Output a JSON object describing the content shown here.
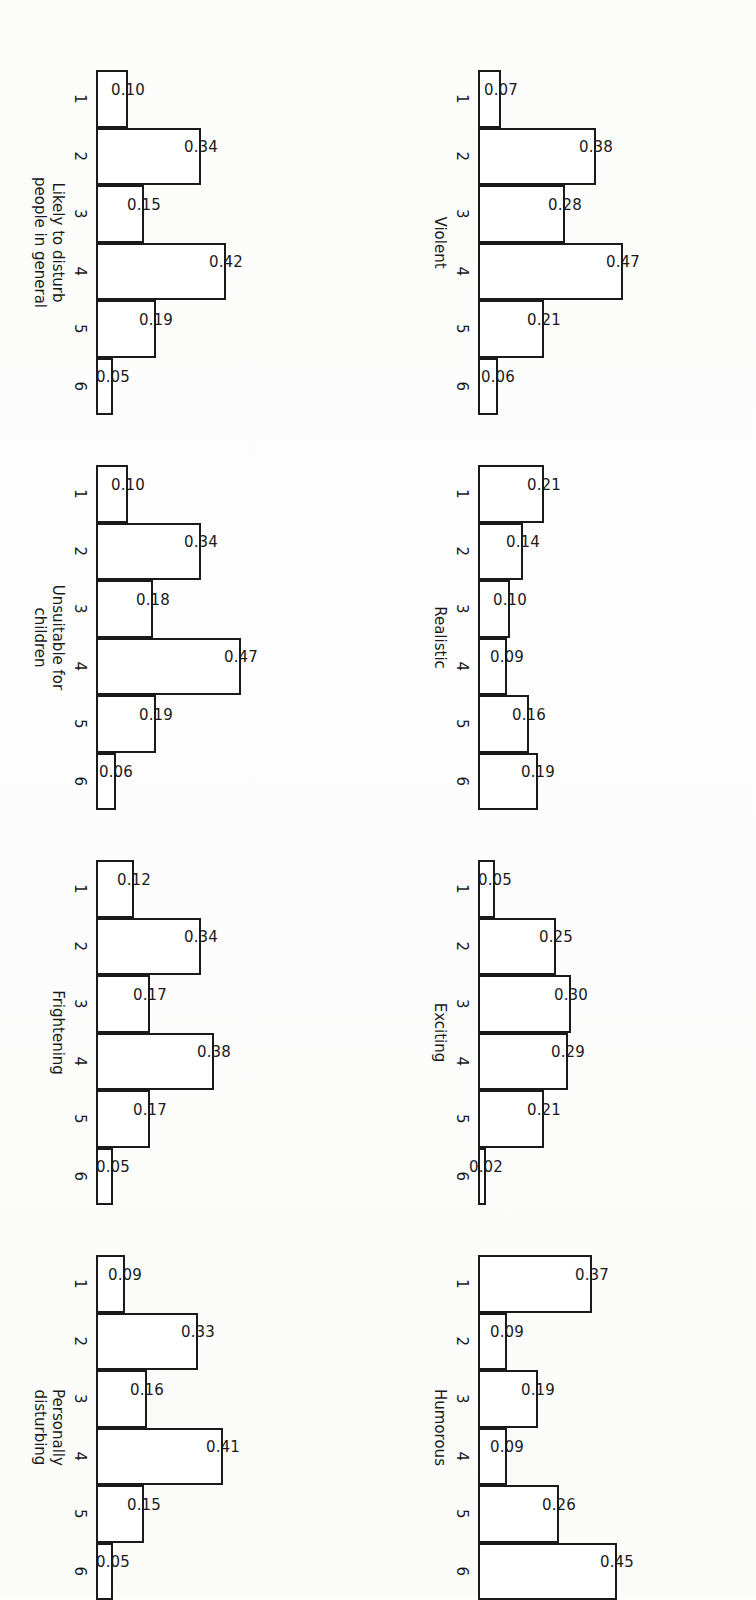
{
  "figure": {
    "type": "small-multiples-histogram-grid",
    "rows": 4,
    "columns": 2,
    "orientation": "page rotated 90 degrees; bars drawn horizontally pointing left",
    "axis_scale_note": "bar length proportional to proportion value",
    "tick_labels": [
      "1",
      "2",
      "3",
      "4",
      "5",
      "6"
    ]
  },
  "chart_data": [
    {
      "type": "bar",
      "title": "Violent",
      "categories": [
        "1",
        "2",
        "3",
        "4",
        "5",
        "6"
      ],
      "values": [
        0.07,
        0.38,
        0.28,
        0.47,
        0.21,
        0.06
      ],
      "value_labels": [
        "0.07",
        "0.38",
        "0.28",
        "0.47",
        "0.21",
        "0.06"
      ],
      "xlabel": "",
      "ylabel": "",
      "ylim": [
        0,
        0.47
      ],
      "grid": false,
      "legend": "none"
    },
    {
      "type": "bar",
      "title": "Realistic",
      "categories": [
        "1",
        "2",
        "3",
        "4",
        "5",
        "6"
      ],
      "values": [
        0.21,
        0.14,
        0.1,
        0.09,
        0.16,
        0.19
      ],
      "value_labels": [
        "0.21",
        "0.14",
        "0.10",
        "0.09",
        "0.16",
        "0.19"
      ],
      "xlabel": "",
      "ylabel": "",
      "ylim": [
        0,
        0.47
      ],
      "grid": false,
      "legend": "none"
    },
    {
      "type": "bar",
      "title": "Exciting",
      "categories": [
        "1",
        "2",
        "3",
        "4",
        "5",
        "6"
      ],
      "values": [
        0.05,
        0.25,
        0.3,
        0.29,
        0.21,
        0.02
      ],
      "value_labels": [
        "0.05",
        "0.25",
        "0.30",
        "0.29",
        "0.21",
        "0.02"
      ],
      "xlabel": "",
      "ylabel": "",
      "ylim": [
        0,
        0.47
      ],
      "grid": false,
      "legend": "none"
    },
    {
      "type": "bar",
      "title": "Humorous",
      "categories": [
        "1",
        "2",
        "3",
        "4",
        "5",
        "6"
      ],
      "values": [
        0.37,
        0.09,
        0.19,
        0.09,
        0.26,
        0.45
      ],
      "value_labels": [
        "0.37",
        "0.09",
        "0.19",
        "0.09",
        "0.26",
        "0.45"
      ],
      "xlabel": "",
      "ylabel": "",
      "ylim": [
        0,
        0.47
      ],
      "grid": false,
      "legend": "none"
    },
    {
      "type": "bar",
      "title": "Likely to disturb people in general",
      "title_lines": [
        "Likely to disturb",
        "people in general"
      ],
      "categories": [
        "1",
        "2",
        "3",
        "4",
        "5",
        "6"
      ],
      "values": [
        0.1,
        0.34,
        0.15,
        0.42,
        0.19,
        0.05
      ],
      "value_labels": [
        "0.10",
        "0.34",
        "0.15",
        "0.42",
        "0.19",
        "0.05"
      ],
      "xlabel": "",
      "ylabel": "",
      "ylim": [
        0,
        0.47
      ],
      "grid": false,
      "legend": "none"
    },
    {
      "type": "bar",
      "title": "Unsuitable for children",
      "title_lines": [
        "Unsuitable for",
        "children"
      ],
      "categories": [
        "1",
        "2",
        "3",
        "4",
        "5",
        "6"
      ],
      "values": [
        0.1,
        0.34,
        0.18,
        0.47,
        0.19,
        0.06
      ],
      "value_labels": [
        "0.10",
        "0.34",
        "0.18",
        "0.47",
        "0.19",
        "0.06"
      ],
      "xlabel": "",
      "ylabel": "",
      "ylim": [
        0,
        0.47
      ],
      "grid": false,
      "legend": "none"
    },
    {
      "type": "bar",
      "title": "Frightening",
      "categories": [
        "1",
        "2",
        "3",
        "4",
        "5",
        "6"
      ],
      "values": [
        0.12,
        0.34,
        0.17,
        0.38,
        0.17,
        0.05
      ],
      "value_labels": [
        "0.12",
        "0.34",
        "0.17",
        "0.38",
        "0.17",
        "0.05"
      ],
      "xlabel": "",
      "ylabel": "",
      "ylim": [
        0,
        0.47
      ],
      "grid": false,
      "legend": "none"
    },
    {
      "type": "bar",
      "title": "Personally disturbing",
      "title_lines": [
        "Personally",
        "disturbing"
      ],
      "categories": [
        "1",
        "2",
        "3",
        "4",
        "5",
        "6"
      ],
      "values": [
        0.09,
        0.33,
        0.16,
        0.41,
        0.15,
        0.05
      ],
      "value_labels": [
        "0.09",
        "0.33",
        "0.16",
        "0.41",
        "0.15",
        "0.05"
      ],
      "xlabel": "",
      "ylabel": "",
      "ylim": [
        0,
        0.47
      ],
      "grid": false,
      "legend": "none"
    }
  ],
  "colors": {
    "ink": "#1a1a1a",
    "bar_fill": "#ffffff",
    "page": "#fdfdfc"
  }
}
